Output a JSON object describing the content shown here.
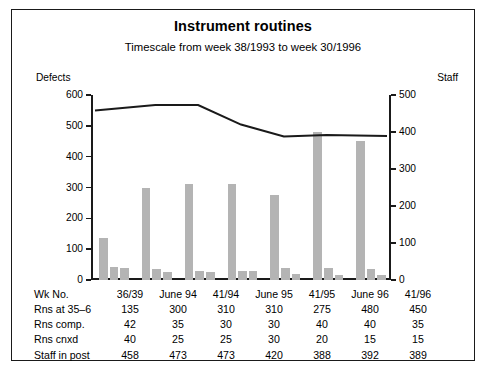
{
  "chart_data": {
    "type": "bar",
    "title": "Instrument routines",
    "subtitle": "Timescale from week 38/1993 to week 30/1996",
    "xlabel": "",
    "ylabel": "Defects",
    "y2label": "Staff",
    "ylim": [
      0,
      600
    ],
    "y2lim": [
      0,
      500
    ],
    "yticks": [
      0,
      100,
      200,
      300,
      400,
      500,
      600
    ],
    "y2ticks": [
      0,
      100,
      200,
      300,
      400,
      500
    ],
    "grid": false,
    "legend": "none",
    "categories": [
      "36/39",
      "June 94",
      "41/94",
      "June 95",
      "41/95",
      "June 96",
      "41/96"
    ],
    "series": [
      {
        "name": "Rns at 35-6",
        "kind": "bar",
        "axis": "left",
        "values": [
          135,
          300,
          310,
          310,
          275,
          480,
          450
        ]
      },
      {
        "name": "Rns comp.",
        "kind": "bar",
        "axis": "left",
        "values": [
          42,
          35,
          30,
          30,
          40,
          40,
          35
        ]
      },
      {
        "name": "Rns cnxd",
        "kind": "bar",
        "axis": "left",
        "values": [
          40,
          25,
          25,
          30,
          20,
          15,
          15
        ]
      },
      {
        "name": "Staff in post",
        "kind": "line",
        "axis": "right",
        "values": [
          458,
          473,
          473,
          420,
          388,
          392,
          389
        ]
      }
    ],
    "bar_color": "#b4b4b4",
    "line_color": "#1a1a1a"
  },
  "header": {
    "title": "Instrument routines",
    "subtitle": "Timescale from week 38/1993 to week 30/1996"
  },
  "axes": {
    "left_caption": "Defects",
    "right_caption": "Staff",
    "left_ticks": [
      "600",
      "500",
      "400",
      "300",
      "200",
      "100",
      "0"
    ],
    "right_ticks": [
      "500",
      "400",
      "300",
      "200",
      "100",
      "0"
    ]
  },
  "table": {
    "rows": [
      {
        "label": "Wk No.",
        "values": [
          "36/39",
          "June 94",
          "41/94",
          "June 95",
          "41/95",
          "June 96",
          "41/96"
        ]
      },
      {
        "label": "Rns at 35–6",
        "values": [
          "135",
          "300",
          "310",
          "310",
          "275",
          "480",
          "450"
        ]
      },
      {
        "label": "Rns comp.",
        "values": [
          "42",
          "35",
          "30",
          "30",
          "40",
          "40",
          "35"
        ]
      },
      {
        "label": "Rns cnxd",
        "values": [
          "40",
          "25",
          "25",
          "30",
          "20",
          "15",
          "15"
        ]
      },
      {
        "label": "Staff in post",
        "values": [
          "458",
          "473",
          "473",
          "420",
          "388",
          "392",
          "389"
        ]
      }
    ]
  }
}
